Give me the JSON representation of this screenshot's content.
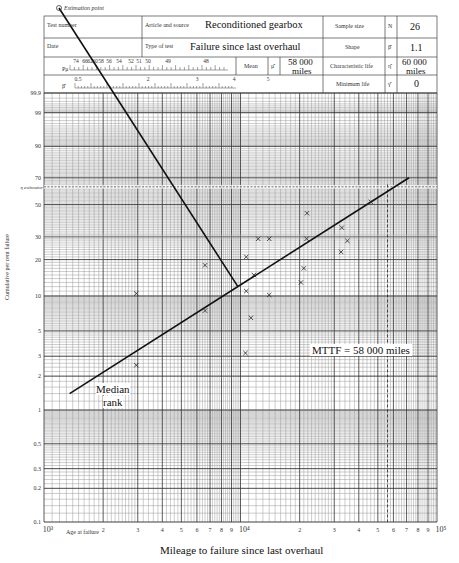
{
  "header": {
    "estimation_point_label": "Estimation point",
    "test_number_label": "Test number",
    "date_label": "Date",
    "article_label": "Article and source",
    "article_value": "Reconditioned gearbox",
    "test_type_label": "Type of test",
    "test_type_value": "Failure since last overhaul",
    "sample_size_label": "Sample size",
    "sample_size_symbol": "N",
    "sample_size_value": "26",
    "shape_label": "Shape",
    "shape_symbol": "β̂",
    "shape_value": "1.1",
    "mean_label": "Mean",
    "mean_symbol": "μ̂",
    "mean_value_line1": "58 000",
    "mean_value_line2": "miles",
    "char_life_label": "Characteristic life",
    "char_life_symbol": "η̂",
    "char_life_value_line1": "60 000",
    "char_life_value_line2": "miles",
    "min_life_label": "Minimum life",
    "min_life_symbol": "γ̂",
    "min_life_value": "0",
    "pu_label": "Pμ",
    "pu_scale": [
      "74",
      "66",
      "62",
      "60",
      "58",
      "56",
      "54",
      "52",
      "51",
      "50",
      "49",
      "48"
    ],
    "beta_symbol": "β̂",
    "beta_scale": [
      "0.5",
      "2",
      "3",
      "4",
      "5"
    ]
  },
  "chart_data": {
    "type": "scatter",
    "xlabel": "Mileage to failure since last overhaul",
    "xlabel_secondary": "Age at failure",
    "ylabel": "Cumulative per cent failure",
    "x_scale": "log",
    "xlim": [
      1000,
      100000
    ],
    "x_tick_labels": [
      "10³",
      "2",
      "3",
      "4",
      "5",
      "6",
      "7",
      "8",
      "9",
      "10⁴",
      "2",
      "3",
      "4",
      "5",
      "6",
      "7",
      "8",
      "9",
      "10⁵"
    ],
    "y_scale": "weibull",
    "y_tick_labels": [
      "0.1",
      "0.2",
      "0.3",
      "0.5",
      "1",
      "2",
      "3",
      "5",
      "10",
      "20",
      "30",
      "50",
      "70",
      "90",
      "99",
      "99.9"
    ],
    "grid": true,
    "eta_estimator_label": "η estimator",
    "eta_estimator_percent": 63.2,
    "points": [
      {
        "x": 2950,
        "y": 2.5
      },
      {
        "x": 2950,
        "y": 10.5
      },
      {
        "x": 6600,
        "y": 7.5
      },
      {
        "x": 6600,
        "y": 18
      },
      {
        "x": 10600,
        "y": 3.2
      },
      {
        "x": 10700,
        "y": 11
      },
      {
        "x": 10700,
        "y": 21
      },
      {
        "x": 11300,
        "y": 6.5
      },
      {
        "x": 11700,
        "y": 15
      },
      {
        "x": 12300,
        "y": 29
      },
      {
        "x": 14000,
        "y": 10.2
      },
      {
        "x": 14000,
        "y": 29
      },
      {
        "x": 20300,
        "y": 13
      },
      {
        "x": 21000,
        "y": 17
      },
      {
        "x": 21700,
        "y": 29
      },
      {
        "x": 21800,
        "y": 44
      },
      {
        "x": 32500,
        "y": 23
      },
      {
        "x": 32800,
        "y": 35
      },
      {
        "x": 35000,
        "y": 28
      },
      {
        "x": 46000,
        "y": 52
      }
    ],
    "fit_line": {
      "x": [
        1350,
        72000
      ],
      "y": [
        1.4,
        70
      ]
    },
    "estimation_line": {
      "x": [
        1320,
        9700
      ],
      "y": [
        99.99,
        12
      ]
    },
    "mttf_x": 56000,
    "annotations": [
      {
        "text": "MTTF = 58 000 miles",
        "x": 20000,
        "y": 3.2
      },
      {
        "text": "Median rank",
        "x": 2000,
        "y": 1.2
      }
    ]
  },
  "annotations": {
    "mttf": "MTTF = 58 000 miles",
    "median_line1": "Median",
    "median_line2": "rank"
  }
}
